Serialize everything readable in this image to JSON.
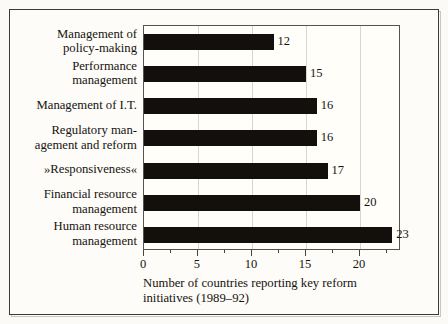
{
  "chart_data": {
    "type": "bar",
    "orientation": "horizontal",
    "title": "",
    "subtitle": "",
    "xlabel": "Number of countries reporting key reform initiatives (1989–92)",
    "ylabel": "",
    "categories": [
      "Management of policy-making",
      "Performance management",
      "Management of I.T.",
      "Regulatory management and reform",
      "»Responsiveness«",
      "Financial resource management",
      "Human resource management"
    ],
    "category_lines": [
      [
        "Management of",
        "policy-making"
      ],
      [
        "Performance",
        "management"
      ],
      [
        "Management of I.T."
      ],
      [
        "Regulatory man-",
        "agement and reform"
      ],
      [
        "»Responsiveness«"
      ],
      [
        "Financial resource",
        "management"
      ],
      [
        "Human resource",
        "management"
      ]
    ],
    "values": [
      12,
      15,
      16,
      16,
      17,
      20,
      23
    ],
    "value_labels": [
      "12",
      "15",
      "16",
      "16",
      "17",
      "20",
      "23"
    ],
    "xlim": [
      0,
      23.8
    ],
    "xticks": [
      0,
      5,
      10,
      15,
      20
    ],
    "xticklabels": [
      "0",
      "5",
      "10",
      "15",
      "20"
    ],
    "xminorticks": [
      2.5,
      7.5,
      12.5,
      17.5,
      22.5
    ],
    "gridlines": [
      5,
      10,
      15,
      20
    ],
    "grid": true,
    "legend": false,
    "legend_position": "none",
    "colors": {
      "bar": "#120f0c",
      "plot_background": "#fffef9",
      "figure_background": "#fdfcf8",
      "gridline": "#d8d6d0",
      "axis": "#55534e",
      "text": "#16130f",
      "frame": "#3b3a37"
    }
  },
  "caption_lines": [
    "Number of countries reporting key reform",
    "initiatives (1989–92)"
  ]
}
